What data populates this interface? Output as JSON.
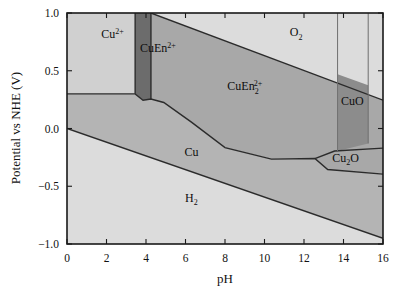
{
  "chart_data": {
    "type": "area",
    "title": "",
    "xlabel": "pH",
    "ylabel": "Potential vs NHE (V)",
    "xlim": [
      0,
      16
    ],
    "ylim": [
      -1.0,
      1.0
    ],
    "xticks": [
      0,
      2,
      4,
      6,
      8,
      10,
      12,
      14,
      16
    ],
    "xtick_labels": [
      "0",
      "2",
      "4",
      "6",
      "8",
      "10",
      "12",
      "14",
      "16"
    ],
    "yticks": [
      -1.0,
      -0.5,
      0.0,
      0.5,
      1.0
    ],
    "ytick_labels": [
      "−1.0",
      "−0.5",
      "0.0",
      "0.5",
      "1.0"
    ],
    "grid": false,
    "legend": "none",
    "regions": [
      {
        "id": "cu2plus",
        "label": "Cu",
        "label_sup": "2+",
        "label_sub": "",
        "label_x": 2.3,
        "label_y": 0.78,
        "color": "#d0d0d0",
        "polygon": [
          [
            0,
            1.0
          ],
          [
            3.45,
            1.0
          ],
          [
            3.45,
            0.3
          ],
          [
            0,
            0.3
          ]
        ]
      },
      {
        "id": "cuen2plus",
        "label": "CuEn",
        "label_sup": "2+",
        "label_sub": "",
        "label_x": 4.6,
        "label_y": 0.66,
        "color": "#6c6c6c",
        "polygon": [
          [
            3.45,
            1.0
          ],
          [
            4.25,
            1.0
          ],
          [
            4.25,
            0.255
          ],
          [
            3.85,
            0.245
          ],
          [
            3.45,
            0.3
          ]
        ]
      },
      {
        "id": "o2",
        "label": "O",
        "label_sup": "",
        "label_sub": "2",
        "label_x": 11.6,
        "label_y": 0.8,
        "color": "#dcdcdc",
        "polygon": [
          [
            4.25,
            1.0
          ],
          [
            16.0,
            1.0
          ],
          [
            16.0,
            0.245
          ],
          [
            4.25,
            1.0
          ]
        ]
      },
      {
        "id": "cuen2_2plus",
        "label": "CuEn",
        "label_sup": "2+",
        "label_sub": "2",
        "label_x": 9.0,
        "label_y": 0.33,
        "color": "#a8a8a8",
        "polygon": [
          [
            4.25,
            1.0
          ],
          [
            16.0,
            0.245
          ],
          [
            16.0,
            -0.17
          ],
          [
            13.55,
            -0.195
          ],
          [
            12.55,
            -0.26
          ],
          [
            10.35,
            -0.265
          ],
          [
            8.0,
            -0.165
          ],
          [
            6.3,
            0.055
          ],
          [
            4.9,
            0.225
          ],
          [
            4.25,
            0.255
          ]
        ]
      },
      {
        "id": "cuo",
        "label": "CuO",
        "label_sup": "",
        "label_sub": "",
        "label_x": 14.45,
        "label_y": 0.2,
        "color": "#8c8c8c",
        "polygon": [
          [
            13.7,
            0.47
          ],
          [
            15.25,
            0.375
          ],
          [
            15.25,
            -0.13
          ],
          [
            13.7,
            -0.195
          ]
        ]
      },
      {
        "id": "cu2o",
        "label": "Cu",
        "label_sup": "",
        "label_sub": "2",
        "label_suffix": "O",
        "label_x": 14.1,
        "label_y": -0.29,
        "color": "#a8a8a8",
        "polygon": [
          [
            12.55,
            -0.26
          ],
          [
            13.55,
            -0.195
          ],
          [
            16.0,
            -0.17
          ],
          [
            16.0,
            -0.395
          ],
          [
            13.2,
            -0.355
          ]
        ]
      },
      {
        "id": "cu",
        "label": "Cu",
        "label_sup": "",
        "label_sub": "",
        "label_x": 6.3,
        "label_y": -0.235,
        "color": "#b4b4b4",
        "polygon": [
          [
            0,
            0.3
          ],
          [
            3.45,
            0.3
          ],
          [
            3.85,
            0.245
          ],
          [
            4.25,
            0.255
          ],
          [
            4.9,
            0.225
          ],
          [
            6.3,
            0.055
          ],
          [
            8.0,
            -0.165
          ],
          [
            10.35,
            -0.265
          ],
          [
            12.55,
            -0.26
          ],
          [
            13.2,
            -0.355
          ],
          [
            16.0,
            -0.395
          ],
          [
            16.0,
            -0.95
          ],
          [
            0,
            0.0
          ]
        ]
      },
      {
        "id": "h2",
        "label": "H",
        "label_sup": "",
        "label_sub": "2",
        "label_x": 6.3,
        "label_y": -0.635,
        "color": "#dcdcdc",
        "polygon": [
          [
            0,
            0.0
          ],
          [
            16.0,
            -0.95
          ],
          [
            16.0,
            -1.0
          ],
          [
            0,
            -1.0
          ]
        ]
      }
    ],
    "boundaries": [
      [
        [
          0,
          0.3
        ],
        [
          3.45,
          0.3
        ],
        [
          3.85,
          0.245
        ],
        [
          4.25,
          0.255
        ],
        [
          4.9,
          0.225
        ],
        [
          6.3,
          0.055
        ],
        [
          8.0,
          -0.165
        ],
        [
          10.35,
          -0.265
        ],
        [
          12.55,
          -0.26
        ],
        [
          13.2,
          -0.355
        ],
        [
          16.0,
          -0.395
        ]
      ],
      [
        [
          0,
          0.0
        ],
        [
          16.0,
          -0.95
        ]
      ],
      [
        [
          4.25,
          1.0
        ],
        [
          16.0,
          0.245
        ]
      ],
      [
        [
          3.45,
          1.0
        ],
        [
          3.45,
          0.3
        ]
      ],
      [
        [
          4.25,
          1.0
        ],
        [
          4.25,
          0.255
        ]
      ],
      [
        [
          12.55,
          -0.26
        ],
        [
          13.55,
          -0.195
        ],
        [
          16.0,
          -0.17
        ]
      ],
      [
        [
          13.7,
          1.0
        ],
        [
          13.7,
          -0.195
        ]
      ],
      [
        [
          15.25,
          1.0
        ],
        [
          15.25,
          -0.13
        ]
      ]
    ]
  },
  "axes": {
    "x_title": "pH",
    "y_title": "Potential vs NHE (V)"
  }
}
